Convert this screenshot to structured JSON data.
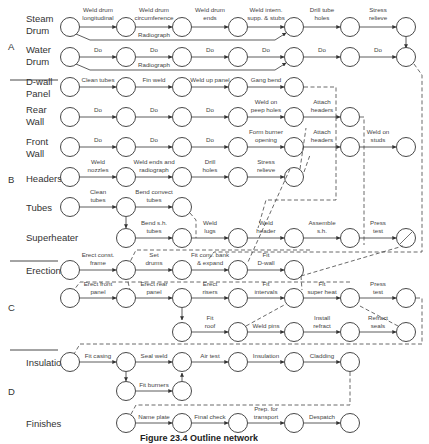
{
  "groups": [
    {
      "id": "A",
      "label": "A"
    },
    {
      "id": "B",
      "label": "B"
    },
    {
      "id": "C",
      "label": "C"
    },
    {
      "id": "D",
      "label": "D"
    }
  ],
  "rows": [
    {
      "label1": "Steam",
      "label2": "Drum"
    },
    {
      "label1": "Water",
      "label2": "Drum"
    },
    {
      "label1": "D-wall",
      "label2": "Panel"
    },
    {
      "label1": "Rear",
      "label2": "Wall"
    },
    {
      "label1": "Front",
      "label2": "Wall"
    },
    {
      "label1": "Headers",
      "label2": ""
    },
    {
      "label1": "Tubes",
      "label2": ""
    },
    {
      "label1": "Superheater",
      "label2": ""
    },
    {
      "label1": "Erection",
      "label2": ""
    },
    {
      "label1": "Insulation",
      "label2": ""
    },
    {
      "label1": "Finishes",
      "label2": ""
    }
  ],
  "activities": {
    "steam_drum": [
      {
        "l1": "Weld drum",
        "l2": "longitudinal"
      },
      {
        "l1": "Weld drum",
        "l2": "circumference"
      },
      {
        "l1": "Weld drum",
        "l2": "ends"
      },
      {
        "l1": "Weld intern.",
        "l2": "supp. & stubs"
      },
      {
        "l1": "Drill tube",
        "l2": "holes"
      },
      {
        "l1": "Stress",
        "l2": "relieve"
      },
      {
        "l1": "Radiograph",
        "l2": ""
      }
    ],
    "water_drum": [
      {
        "l1": "Do"
      },
      {
        "l1": "Do"
      },
      {
        "l1": "Do"
      },
      {
        "l1": "Do"
      },
      {
        "l1": "Do"
      },
      {
        "l1": "Do"
      },
      {
        "l1": "Radiograph"
      }
    ],
    "dwall": [
      {
        "l1": "Clean tubes"
      },
      {
        "l1": "Fin weld"
      },
      {
        "l1": "Weld up panel"
      },
      {
        "l1": "Gang bend"
      }
    ],
    "rear_wall": [
      {
        "l1": "Do"
      },
      {
        "l1": "Do"
      },
      {
        "l1": "Do"
      },
      {
        "l1": "Weld on",
        "l2": "peep holes"
      },
      {
        "l1": "Attach",
        "l2": "headers"
      }
    ],
    "front_wall": [
      {
        "l1": "Do"
      },
      {
        "l1": "Do"
      },
      {
        "l1": "Do"
      },
      {
        "l1": "Form burner",
        "l2": "opening"
      },
      {
        "l1": "Attach",
        "l2": "headers"
      },
      {
        "l1": "Weld on",
        "l2": "studs"
      }
    ],
    "headers": [
      {
        "l1": "Weld",
        "l2": "nozzles"
      },
      {
        "l1": "Weld ends and",
        "l2": "radiograph"
      },
      {
        "l1": "Drill",
        "l2": "holes"
      },
      {
        "l1": "Stress",
        "l2": "relieve"
      }
    ],
    "tubes": [
      {
        "l1": "Clean",
        "l2": "tubes"
      },
      {
        "l1": "Bend convect",
        "l2": "tubes"
      }
    ],
    "superheater": [
      {
        "l1": "Bend s.h.",
        "l2": "tubes"
      },
      {
        "l1": "Weld",
        "l2": "lugs"
      },
      {
        "l1": "Weld",
        "l2": "header"
      },
      {
        "l1": "Assemble",
        "l2": "s.h."
      },
      {
        "l1": "Press",
        "l2": "test"
      }
    ],
    "erection1": [
      {
        "l1": "Erect const.",
        "l2": "frame"
      },
      {
        "l1": "Set",
        "l2": "drums"
      },
      {
        "l1": "Fit conv. bank",
        "l2": "& expand"
      },
      {
        "l1": "Fit",
        "l2": "D-wall"
      },
      {
        "l1": "Remove",
        "l2": "frame"
      }
    ],
    "erection2": [
      {
        "l1": "Erect front",
        "l2": "panel"
      },
      {
        "l1": "Erect rear",
        "l2": "panel"
      },
      {
        "l1": "Erect",
        "l2": "risers"
      },
      {
        "l1": "Fit",
        "l2": "intervals"
      },
      {
        "l1": "Fit",
        "l2": "super heat"
      },
      {
        "l1": "Press",
        "l2": "test"
      }
    ],
    "erection3": [
      {
        "l1": "Fit",
        "l2": "roof"
      },
      {
        "l1": "Weld pins"
      },
      {
        "l1": "Install",
        "l2": "refract"
      },
      {
        "l1": "Refract",
        "l2": "seals"
      }
    ],
    "insulation": [
      {
        "l1": "Fit casing"
      },
      {
        "l1": "Seal weld"
      },
      {
        "l1": "Air test"
      },
      {
        "l1": "Insulation"
      },
      {
        "l1": "Cladding"
      },
      {
        "l1": "Fit burners"
      }
    ],
    "finishes": [
      {
        "l1": "Name plate"
      },
      {
        "l1": "Final check"
      },
      {
        "l1": "Prep. for",
        "l2": "transport"
      },
      {
        "l1": "Despatch"
      }
    ]
  },
  "caption": "Figure 23.4  Outline network"
}
